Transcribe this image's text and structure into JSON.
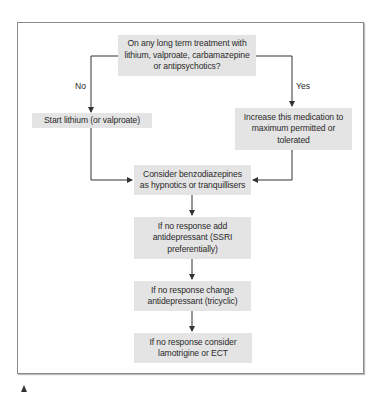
{
  "flowchart": {
    "nodes": {
      "question": "On any long term treatment with lithium, valproate, carbamazepine or antipsychotics?",
      "no_branch": "Start lithium (or valproate)",
      "yes_branch": "Increase this medication to maximum permitted or tolerated",
      "benzo": "Consider benzodiazepines as hypnotics or tranquillisers",
      "ssri": "If no response add antidepressant (SSRI preferentially)",
      "tricyclic": "If no response change antidepressant (tricyclic)",
      "final": "If no response consider lamotrigine or ECT"
    },
    "edge_labels": {
      "no": "No",
      "yes": "Yes"
    },
    "edges": [
      {
        "from": "question",
        "to": "no_branch",
        "label": "No"
      },
      {
        "from": "question",
        "to": "yes_branch",
        "label": "Yes"
      },
      {
        "from": "no_branch",
        "to": "benzo"
      },
      {
        "from": "yes_branch",
        "to": "benzo"
      },
      {
        "from": "benzo",
        "to": "ssri"
      },
      {
        "from": "ssri",
        "to": "tricyclic"
      },
      {
        "from": "tricyclic",
        "to": "final"
      }
    ]
  },
  "colors": {
    "box_fill": "#e4e4e4",
    "line": "#333333",
    "frame": "#8a8a8a"
  }
}
